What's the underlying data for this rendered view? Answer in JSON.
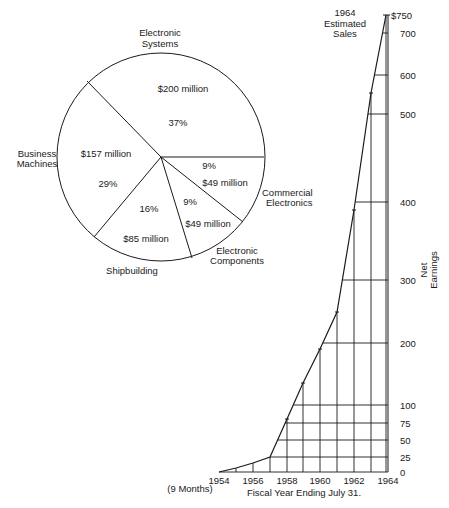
{
  "chart_data": [
    {
      "type": "pie",
      "title": "",
      "slices": [
        {
          "label": "Electronic Systems",
          "value_text": "$200 million",
          "value": 200,
          "percent": 37
        },
        {
          "label": "Commercial Electronics",
          "value_text": "$49 million",
          "value": 49,
          "percent": 9
        },
        {
          "label": "Electronic Components",
          "value_text": "$49 million",
          "value": 49,
          "percent": 9
        },
        {
          "label": "Shipbuilding",
          "value_text": "$85 million",
          "value": 85,
          "percent": 16
        },
        {
          "label": "Business Machines",
          "value_text": "$157 million",
          "value": 157,
          "percent": 29
        }
      ]
    },
    {
      "type": "line",
      "title": "",
      "xlabel": "Fiscal Year Ending July 31.",
      "xlabel_note": "(9 Months)",
      "ylabel": "Net Earnings",
      "annotation": "1964 Estimated Sales",
      "x": [
        1954,
        1955,
        1956,
        1957,
        1958,
        1959,
        1960,
        1961,
        1962,
        1963,
        1964
      ],
      "values": [
        0,
        5,
        13,
        25,
        80,
        140,
        190,
        250,
        390,
        550,
        750
      ],
      "x_tick_labels": [
        "1954",
        "1956",
        "1958",
        "1960",
        "1962",
        "1964"
      ],
      "y_tick_labels": [
        "0",
        "25",
        "50",
        "75",
        "100",
        "200",
        "300",
        "400",
        "500",
        "600",
        "700",
        "$750"
      ],
      "ylim": [
        0,
        750
      ],
      "grid": true
    }
  ],
  "pie": {
    "center": [
      161,
      157
    ],
    "radius": 104,
    "spokes": [
      [
        264,
        157
      ],
      [
        87,
        81
      ],
      [
        94,
        237
      ],
      [
        192,
        258
      ],
      [
        243,
        222
      ]
    ],
    "labels": {
      "electronic_systems": [
        "Electronic",
        "Systems"
      ],
      "business_machines": [
        "Business",
        "Machines"
      ],
      "commercial_electronics": [
        "Commercial",
        "Electronics"
      ],
      "electronic_components": [
        "Electronic",
        "Components"
      ],
      "shipbuilding": "Shipbuilding"
    },
    "inner": {
      "es_value": "$200 million",
      "es_pct": "37%",
      "bm_value": "$157 million",
      "bm_pct": "29%",
      "ce_pct": "9%",
      "ce_value": "$49 million",
      "ec_pct": "9%",
      "ec_value": "$49 million",
      "sb_pct": "16%",
      "sb_value": "$85 million"
    }
  },
  "line": {
    "axis_x_right": 388,
    "baseline_y": 472,
    "year_x": {
      "1954": 219,
      "1955": 236,
      "1956": 253,
      "1957": 270,
      "1958": 287,
      "1959": 303,
      "1960": 320,
      "1961": 337,
      "1962": 354,
      "1963": 371,
      "1964": 386
    },
    "point_y": {
      "1954": 472,
      "1955": 468,
      "1956": 463,
      "1957": 457,
      "1958": 419,
      "1959": 383,
      "1960": 349,
      "1961": 312,
      "1962": 210,
      "1963": 93,
      "1964": 15
    },
    "gridlines": [
      {
        "value": "0",
        "y": 472
      },
      {
        "value": "25",
        "y": 457
      },
      {
        "value": "50",
        "y": 440
      },
      {
        "value": "75",
        "y": 423
      },
      {
        "value": "100",
        "y": 405
      },
      {
        "value": "200",
        "y": 343
      },
      {
        "value": "300",
        "y": 280
      },
      {
        "value": "400",
        "y": 202
      },
      {
        "value": "500",
        "y": 114
      },
      {
        "value": "600",
        "y": 75
      },
      {
        "value": "700",
        "y": 33
      },
      {
        "value": "$750",
        "y": 15
      }
    ],
    "x_ticks": [
      {
        "label": "1954",
        "x": 219
      },
      {
        "label": "1956",
        "x": 253
      },
      {
        "label": "1958",
        "x": 287
      },
      {
        "label": "1960",
        "x": 320
      },
      {
        "label": "1962",
        "x": 354
      },
      {
        "label": "1964",
        "x": 388
      }
    ],
    "annotation": [
      "1964",
      "Estimated",
      "Sales"
    ],
    "ylabel": [
      "Net",
      "Earnings"
    ],
    "xlabel": "Fiscal Year Ending July 31.",
    "xnote": "(9 Months)"
  }
}
